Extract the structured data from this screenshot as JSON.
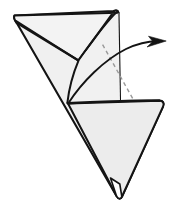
{
  "figure": {
    "caption": "",
    "canvas": {
      "width": 179,
      "height": 218
    },
    "colors": {
      "background": "#ffffff",
      "paper_fill": "#f0f0f0",
      "paper_fill_light": "#f6f6f6",
      "paper_fill_shadow": "#e6e6e6",
      "outline": "#141414",
      "crease_dashed": "#9a9a9a",
      "arrow": "#141414"
    },
    "geometry": {
      "top_left_corner": [
        14,
        15
      ],
      "top_right_corner": [
        118,
        12
      ],
      "bottom_point": [
        120,
        198
      ],
      "right_corner": [
        163,
        106
      ],
      "inner_vertex_upper": [
        78,
        60
      ],
      "inner_vertex_lower": [
        67,
        102
      ],
      "dashed_crease_start": [
        103,
        45
      ],
      "dashed_crease_end": [
        134,
        101
      ],
      "arrow_tip": [
        166,
        41
      ]
    },
    "shapes": {
      "main_body_label": "main-paper-body",
      "upper_flap_label": "upper-left-flap",
      "lower_panel_label": "lower-right-panel",
      "crease_label": "hidden-crease",
      "arrow_label": "fold-direction-arrow"
    }
  }
}
